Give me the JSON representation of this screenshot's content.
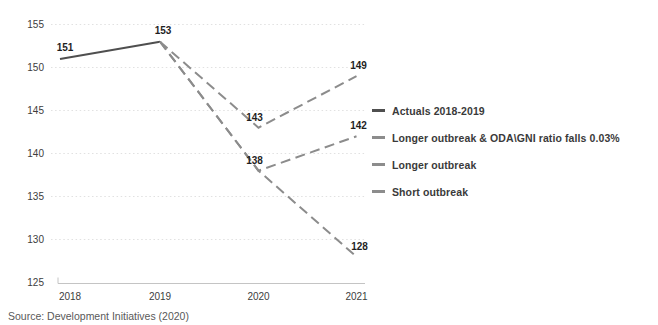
{
  "chart_data": {
    "type": "line",
    "title": "",
    "categories": [
      "2018",
      "2019",
      "2020",
      "2021"
    ],
    "ylim": [
      125,
      155
    ],
    "ytick_step": 5,
    "y_ticks": [
      155,
      150,
      145,
      140,
      135,
      130,
      125
    ],
    "grid": "horizontal-dotted",
    "legend_position": "right",
    "series": [
      {
        "name": "Actuals 2018-2019",
        "points": [
          [
            "2018",
            151
          ],
          [
            "2019",
            153
          ]
        ],
        "style": "solid",
        "color": "#4f4f4f"
      },
      {
        "name": "Longer outbreak & ODA\\GNI ratio falls 0.03%",
        "points": [
          [
            "2019",
            153
          ],
          [
            "2020",
            138
          ],
          [
            "2021",
            128
          ]
        ],
        "style": "dashed",
        "color": "#8c8c8c"
      },
      {
        "name": "Longer outbreak",
        "points": [
          [
            "2019",
            153
          ],
          [
            "2020",
            138
          ],
          [
            "2021",
            142
          ]
        ],
        "style": "dashed",
        "color": "#8c8c8c"
      },
      {
        "name": "Short outbreak",
        "points": [
          [
            "2019",
            153
          ],
          [
            "2020",
            143
          ],
          [
            "2021",
            149
          ]
        ],
        "style": "dashed",
        "color": "#8c8c8c"
      }
    ],
    "point_labels": [
      151,
      153,
      143,
      138,
      149,
      142,
      128
    ]
  },
  "legend": {
    "items": [
      {
        "label": "Actuals 2018-2019",
        "color": "#4f4f4f"
      },
      {
        "label": "Longer outbreak & ODA\\GNI ratio falls 0.03%",
        "color": "#8c8c8c"
      },
      {
        "label": "Longer outbreak",
        "color": "#8c8c8c"
      },
      {
        "label": "Short outbreak",
        "color": "#8c8c8c"
      }
    ]
  },
  "source": "Source: Development Initiatives (2020)",
  "colors": {
    "grid": "#e1e1e1",
    "axis": "#c4c4c4",
    "tick_text": "#3d3d3d",
    "point_label_text": "#1f1f1f",
    "legend_text": "#3a3a3a",
    "source_text": "#595959",
    "background": "#ffffff"
  }
}
